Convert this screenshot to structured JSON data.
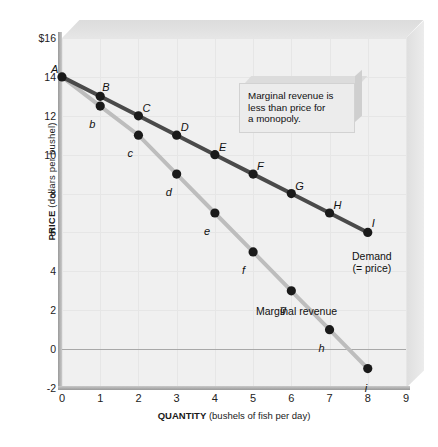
{
  "chart_data": {
    "type": "line",
    "title": "",
    "xlabel_bold": "QUANTITY",
    "xlabel_unit": "(bushels of fish per day)",
    "ylabel_bold": "PRICE",
    "ylabel_unit": "(dollars per bushel)",
    "xlim": [
      0,
      9
    ],
    "ylim": [
      -2,
      16
    ],
    "xticks": [
      "0",
      "1",
      "2",
      "3",
      "4",
      "5",
      "6",
      "7",
      "8",
      "9"
    ],
    "yticks": [
      "$16",
      "14",
      "12",
      "10",
      "8",
      "6",
      "4",
      "2",
      "0",
      "-2"
    ],
    "ytick_values": [
      16,
      14,
      12,
      10,
      8,
      6,
      4,
      2,
      0,
      -2
    ],
    "grid": true,
    "legend_position": "inline-annotations",
    "series": [
      {
        "name": "Demand (= price)",
        "color": "#4a4a4a",
        "label_text": "Demand",
        "label_text2": "(= price)",
        "points": [
          {
            "label": "A",
            "x": 0,
            "y": 14
          },
          {
            "label": "B",
            "x": 1,
            "y": 13
          },
          {
            "label": "C",
            "x": 2,
            "y": 12
          },
          {
            "label": "D",
            "x": 3,
            "y": 11
          },
          {
            "label": "E",
            "x": 4,
            "y": 10
          },
          {
            "label": "F",
            "x": 5,
            "y": 9
          },
          {
            "label": "G",
            "x": 6,
            "y": 8
          },
          {
            "label": "H",
            "x": 7,
            "y": 7
          },
          {
            "label": "I",
            "x": 8,
            "y": 6
          }
        ]
      },
      {
        "name": "Marginal revenue",
        "color": "#bdbdbd",
        "label_text": "Marginal revenue",
        "points": [
          {
            "label": "a",
            "x": 0,
            "y": 14
          },
          {
            "label": "b",
            "x": 1,
            "y": 12.5
          },
          {
            "label": "c",
            "x": 2,
            "y": 11
          },
          {
            "label": "d",
            "x": 3,
            "y": 9
          },
          {
            "label": "e",
            "x": 4,
            "y": 7
          },
          {
            "label": "f",
            "x": 5,
            "y": 5
          },
          {
            "label": "g",
            "x": 6,
            "y": 3
          },
          {
            "label": "h",
            "x": 7,
            "y": 1
          },
          {
            "label": "i",
            "x": 8,
            "y": -1
          }
        ]
      }
    ],
    "annotations": [
      {
        "name": "monopoly-callout",
        "line1": "Marginal revenue is",
        "line2": "less than price for",
        "line3": "a monopoly."
      }
    ]
  }
}
